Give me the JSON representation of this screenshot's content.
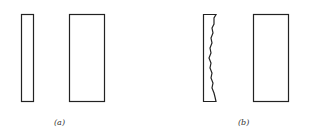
{
  "figure": {
    "panels": [
      {
        "label": "(a)",
        "description": "thin plate and thick plate, smooth surfaces"
      },
      {
        "label": "(b)",
        "description": "thin plate with rough right edge and thick plate"
      }
    ],
    "stroke_color": "#222222"
  }
}
